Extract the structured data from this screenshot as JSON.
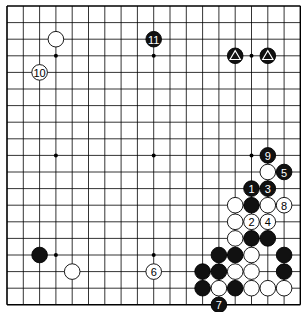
{
  "board": {
    "size": 19,
    "origin_x": 7,
    "origin_y": 6,
    "spacing_x": 16.3,
    "spacing_y": 16.6,
    "line_color": "#000000",
    "background": "#ffffff",
    "star_points": [
      [
        3,
        3
      ],
      [
        9,
        3
      ],
      [
        15,
        3
      ],
      [
        3,
        9
      ],
      [
        9,
        9
      ],
      [
        15,
        9
      ],
      [
        3,
        15
      ],
      [
        9,
        15
      ],
      [
        15,
        15
      ]
    ]
  },
  "stones": [
    {
      "color": "white",
      "col": 3,
      "row": 2,
      "label": ""
    },
    {
      "color": "white",
      "col": 2,
      "row": 4,
      "label": "10"
    },
    {
      "color": "black",
      "col": 9,
      "row": 2,
      "label": "11"
    },
    {
      "color": "black",
      "col": 14,
      "row": 3,
      "label": "",
      "marker": "triangle"
    },
    {
      "color": "black",
      "col": 16,
      "row": 3,
      "label": "",
      "marker": "triangle"
    },
    {
      "color": "black",
      "col": 16,
      "row": 9,
      "label": "9"
    },
    {
      "color": "white",
      "col": 16,
      "row": 10,
      "label": ""
    },
    {
      "color": "black",
      "col": 17,
      "row": 10,
      "label": "5"
    },
    {
      "color": "black",
      "col": 15,
      "row": 11,
      "label": "1"
    },
    {
      "color": "black",
      "col": 16,
      "row": 11,
      "label": "3"
    },
    {
      "color": "white",
      "col": 14,
      "row": 12,
      "label": ""
    },
    {
      "color": "black",
      "col": 15,
      "row": 12,
      "label": ""
    },
    {
      "color": "white",
      "col": 16,
      "row": 12,
      "label": ""
    },
    {
      "color": "white",
      "col": 17,
      "row": 12,
      "label": "8"
    },
    {
      "color": "white",
      "col": 14,
      "row": 13,
      "label": ""
    },
    {
      "color": "white",
      "col": 15,
      "row": 13,
      "label": "2"
    },
    {
      "color": "white",
      "col": 16,
      "row": 13,
      "label": "4"
    },
    {
      "color": "white",
      "col": 14,
      "row": 14,
      "label": ""
    },
    {
      "color": "black",
      "col": 15,
      "row": 14,
      "label": ""
    },
    {
      "color": "black",
      "col": 16,
      "row": 14,
      "label": ""
    },
    {
      "color": "black",
      "col": 13,
      "row": 15,
      "label": ""
    },
    {
      "color": "black",
      "col": 14,
      "row": 15,
      "label": ""
    },
    {
      "color": "white",
      "col": 15,
      "row": 15,
      "label": ""
    },
    {
      "color": "black",
      "col": 17,
      "row": 15,
      "label": ""
    },
    {
      "color": "black",
      "col": 12,
      "row": 16,
      "label": ""
    },
    {
      "color": "black",
      "col": 13,
      "row": 16,
      "label": ""
    },
    {
      "color": "white",
      "col": 14,
      "row": 16,
      "label": ""
    },
    {
      "color": "white",
      "col": 15,
      "row": 16,
      "label": ""
    },
    {
      "color": "black",
      "col": 17,
      "row": 16,
      "label": ""
    },
    {
      "color": "black",
      "col": 12,
      "row": 17,
      "label": ""
    },
    {
      "color": "white",
      "col": 13,
      "row": 17,
      "label": ""
    },
    {
      "color": "black",
      "col": 14,
      "row": 17,
      "label": ""
    },
    {
      "color": "white",
      "col": 15,
      "row": 17,
      "label": ""
    },
    {
      "color": "white",
      "col": 16,
      "row": 17,
      "label": ""
    },
    {
      "color": "white",
      "col": 17,
      "row": 17,
      "label": ""
    },
    {
      "color": "black",
      "col": 13,
      "row": 18,
      "label": "7"
    },
    {
      "color": "black",
      "col": 2,
      "row": 15,
      "label": ""
    },
    {
      "color": "white",
      "col": 4,
      "row": 16,
      "label": ""
    },
    {
      "color": "white",
      "col": 9,
      "row": 16,
      "label": "6"
    }
  ]
}
